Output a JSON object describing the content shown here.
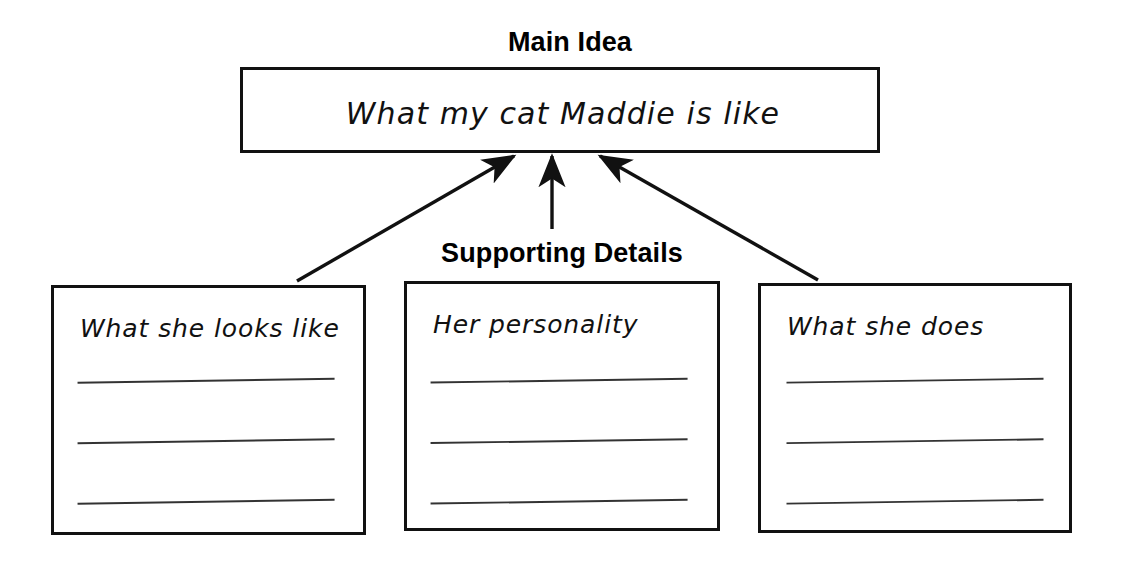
{
  "diagram": {
    "type": "main-idea-supporting-details-graphic-organizer",
    "main_idea_heading": "Main Idea",
    "supporting_details_heading": "Supporting Details",
    "main_idea_text": "What my cat Maddie is like",
    "detail_boxes": [
      {
        "heading": "What she looks like",
        "blank_lines": 3
      },
      {
        "heading": "Her personality",
        "blank_lines": 3
      },
      {
        "heading": "What she does",
        "blank_lines": 3
      }
    ],
    "arrows": [
      {
        "from": "detail-box-0",
        "to": "main-box",
        "direction": "up-right"
      },
      {
        "from": "detail-box-1",
        "to": "main-box",
        "direction": "up"
      },
      {
        "from": "detail-box-2",
        "to": "main-box",
        "direction": "up-left"
      }
    ],
    "colors": {
      "ink": "#111111",
      "background": "#ffffff",
      "rule_line": "#333333"
    }
  }
}
